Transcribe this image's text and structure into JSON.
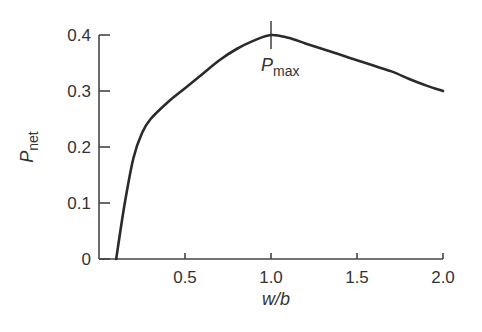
{
  "chart_data": {
    "type": "line",
    "title": "",
    "xlabel": "w/b",
    "ylabel": "P_net",
    "ylabel_main": "P",
    "ylabel_sub": "net",
    "xlim": [
      0,
      2.0
    ],
    "ylim": [
      0,
      0.4
    ],
    "x_ticks": [
      "0.5",
      "1.0",
      "1.5",
      "2.0"
    ],
    "y_ticks": [
      "0",
      "0.1",
      "0.2",
      "0.3",
      "0.4"
    ],
    "grid": false,
    "legend": null,
    "series": [
      {
        "name": "P_net",
        "x": [
          0.1,
          0.15,
          0.2,
          0.25,
          0.3,
          0.4,
          0.5,
          0.6,
          0.7,
          0.8,
          0.9,
          1.0,
          1.1,
          1.2,
          1.3,
          1.4,
          1.5,
          1.6,
          1.7,
          1.8,
          1.9,
          2.0
        ],
        "values": [
          0.0,
          0.1,
          0.18,
          0.225,
          0.25,
          0.28,
          0.305,
          0.33,
          0.355,
          0.375,
          0.39,
          0.4,
          0.395,
          0.385,
          0.375,
          0.365,
          0.355,
          0.345,
          0.335,
          0.322,
          0.31,
          0.3
        ]
      }
    ],
    "annotations": [
      {
        "text_main": "P",
        "text_sub": "max",
        "x": 1.0,
        "y": 0.4,
        "marker": "vertical-line"
      }
    ]
  }
}
